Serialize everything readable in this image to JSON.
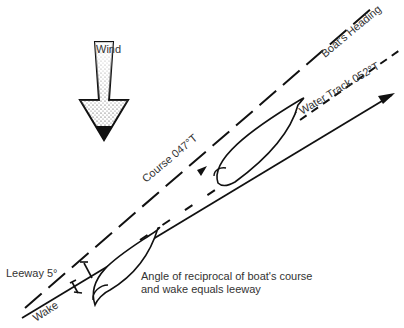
{
  "diagram": {
    "wind": {
      "label": "Wind",
      "icon": "wind-arrow-down"
    },
    "labels": {
      "course": "Course 047°T",
      "boats_heading": "Boat's Heading",
      "water_track": "Water Track 052°T",
      "leeway": "Leeway 5°",
      "wake": "Wake",
      "note_line1": "Angle of reciprocal of boat's course",
      "note_line2": "and wake equals leeway"
    },
    "values": {
      "course_deg": 47,
      "water_track_deg": 52,
      "leeway_deg": 5
    }
  }
}
